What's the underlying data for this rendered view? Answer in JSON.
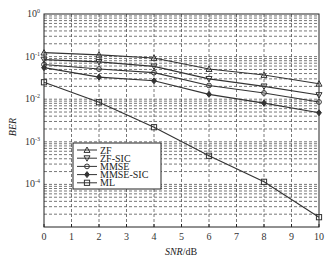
{
  "chart_data": {
    "type": "line",
    "title": "",
    "xlabel": "SNR/dB",
    "xlabel_italic": "SNR",
    "xlabel_unit": "/dB",
    "ylabel": "BER",
    "yscale": "log",
    "xlim": [
      0,
      10
    ],
    "ylim": [
      1e-05,
      1
    ],
    "x_ticks": [
      0,
      1,
      2,
      3,
      4,
      5,
      6,
      7,
      8,
      9,
      10
    ],
    "y_ticks": [
      {
        "value": 1,
        "label_base": "10",
        "label_exp": "0"
      },
      {
        "value": 0.1,
        "label_base": "10",
        "label_exp": "-1"
      },
      {
        "value": 0.01,
        "label_base": "10",
        "label_exp": "-2"
      },
      {
        "value": 0.001,
        "label_base": "10",
        "label_exp": "-3"
      },
      {
        "value": 0.0001,
        "label_base": "10",
        "label_exp": "-4"
      }
    ],
    "grid": true,
    "legend_position": "lower left (inside)",
    "x": [
      0,
      2,
      4,
      6,
      8,
      10
    ],
    "series": [
      {
        "name": "ZF",
        "marker": "triangle-up",
        "values": [
          0.124,
          0.11,
          0.093,
          0.051,
          0.037,
          0.023
        ]
      },
      {
        "name": "ZF-SIC",
        "marker": "triangle-down",
        "values": [
          0.085,
          0.075,
          0.059,
          0.03,
          0.02,
          0.0125
        ]
      },
      {
        "name": "MMSE",
        "marker": "circle",
        "values": [
          0.065,
          0.051,
          0.042,
          0.021,
          0.014,
          0.0086
        ]
      },
      {
        "name": "MMSE-SIC",
        "marker": "diamond",
        "values": [
          0.055,
          0.033,
          0.027,
          0.013,
          0.0081,
          0.0048
        ]
      },
      {
        "name": "ML",
        "marker": "square",
        "values": [
          0.025,
          0.0085,
          0.0022,
          0.00047,
          0.000115,
          1.7e-05
        ]
      }
    ]
  },
  "colors": {
    "line": "#333333",
    "grid": "#555555",
    "axis": "#222222"
  }
}
